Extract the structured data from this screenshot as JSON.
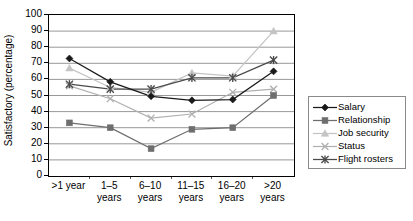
{
  "chart_data": {
    "type": "line",
    "title": "",
    "subtitle": "",
    "xlabel": "",
    "ylabel": "Satisfactory (percentage)",
    "categories": [
      ">1 year",
      "1–5 years",
      "6–10 years",
      "11–15 years",
      "16–20 years",
      ">20 years"
    ],
    "category_lines": [
      [
        ">1 year",
        ""
      ],
      [
        "1–5",
        "years"
      ],
      [
        "6–10",
        "years"
      ],
      [
        "11–15",
        "years"
      ],
      [
        "16–20",
        "years"
      ],
      [
        ">20",
        "years"
      ]
    ],
    "ylim": [
      0,
      100
    ],
    "yticks": [
      100,
      90,
      80,
      70,
      60,
      50,
      40,
      30,
      20,
      10,
      0
    ],
    "grid": "horizontal",
    "legend_position": "right",
    "series": [
      {
        "name": "Salary",
        "marker": "diamond",
        "color": "#1a1a1a",
        "values": [
          73,
          58.5,
          49.5,
          47,
          47.5,
          65
        ]
      },
      {
        "name": "Relationship",
        "marker": "square",
        "color": "#6e6e6e",
        "values": [
          33,
          30,
          17,
          29,
          30,
          50
        ]
      },
      {
        "name": "Job security",
        "marker": "triangle",
        "color": "#c4c4c4",
        "values": [
          67,
          55,
          52,
          64,
          62,
          90
        ]
      },
      {
        "name": "Status",
        "marker": "x",
        "color": "#b0b0b0",
        "values": [
          56,
          48,
          36,
          38.5,
          52,
          54
        ]
      },
      {
        "name": "Flight rosters",
        "marker": "asterisk",
        "color": "#4a4a4a",
        "values": [
          57,
          54,
          54,
          61,
          61,
          72
        ]
      }
    ]
  },
  "legend": {
    "items": [
      {
        "label": "Salary"
      },
      {
        "label": "Relationship"
      },
      {
        "label": "Job security"
      },
      {
        "label": "Status"
      },
      {
        "label": "Flight rosters"
      }
    ]
  }
}
